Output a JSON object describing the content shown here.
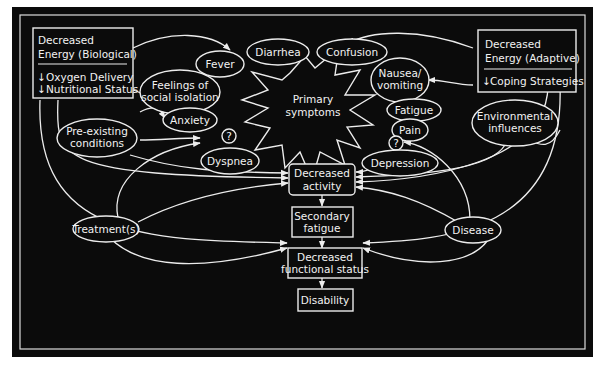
{
  "diagram": {
    "colors": {
      "background": "#0b0b0b",
      "foreground": "#ececec",
      "page": "#ffffff"
    },
    "boxes": {
      "energy_bio": {
        "title_line1": "Decreased",
        "title_line2": "Energy (Biological)",
        "item1": "Oxygen Delivery",
        "item2": "Nutritional Status",
        "arrow": "↓"
      },
      "energy_adaptive": {
        "title_line1": "Decreased",
        "title_line2": "Energy (Adaptive)",
        "item1": "Coping Strategies",
        "arrow": "↓"
      },
      "decreased_activity": {
        "line1": "Decreased",
        "line2": "activity"
      },
      "secondary_fatigue": {
        "line1": "Secondary",
        "line2": "fatigue"
      },
      "functional_status": {
        "line1": "Decreased",
        "line2": "functional status"
      },
      "disability": {
        "line1": "Disability"
      }
    },
    "center": {
      "line1": "Primary",
      "line2": "symptoms"
    },
    "ovals": {
      "fever": "Fever",
      "diarrhea": "Diarrhea",
      "confusion": "Confusion",
      "nausea_1": "Nausea/",
      "nausea_2": "vomiting",
      "isolation_1": "Feelings of",
      "isolation_2": "social isolation",
      "anxiety": "Anxiety",
      "fatigue": "Fatigue",
      "pain": "Pain",
      "preexisting_1": "Pre-existing",
      "preexisting_2": "conditions",
      "environmental_1": "Environmental",
      "environmental_2": "influences",
      "dyspnea": "Dyspnea",
      "depression": "Depression",
      "treatment": "Treatment(s)",
      "disease": "Disease",
      "question_left": "?",
      "question_right": "?"
    }
  }
}
